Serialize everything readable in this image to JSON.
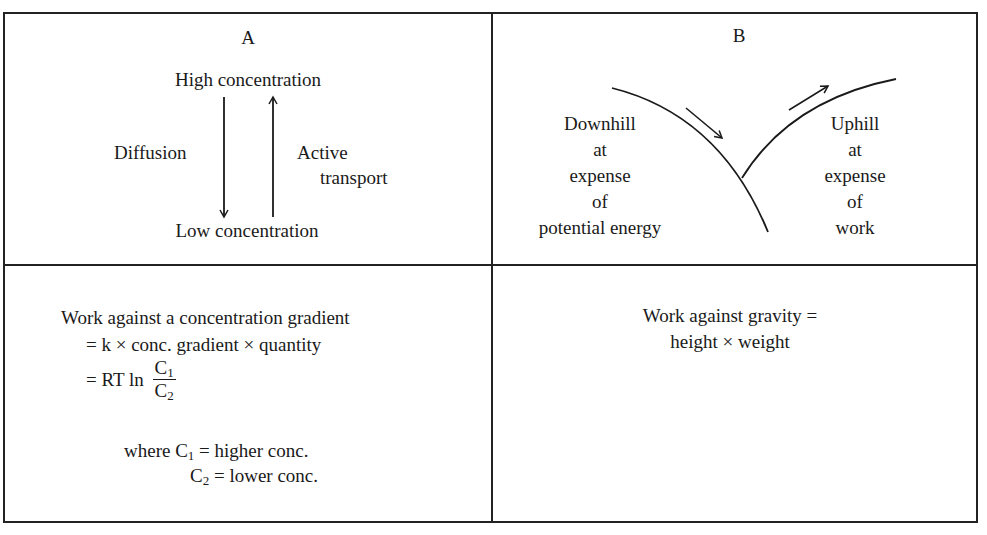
{
  "panel_a": {
    "label": "A",
    "top": "High concentration",
    "bottom": "Low concentration",
    "left_arrow_label": "Diffusion",
    "right_arrow_label_line1": "Active",
    "right_arrow_label_line2": "transport",
    "left_arrow_direction": "down",
    "right_arrow_direction": "up"
  },
  "panel_b": {
    "label": "B",
    "left_text": [
      "Downhill",
      "at",
      "expense",
      "of",
      "potential energy"
    ],
    "right_text": [
      "Uphill",
      "at",
      "expense",
      "of",
      "work"
    ]
  },
  "panel_c": {
    "line1": "Work against a concentration gradient",
    "line2": "= k × conc. gradient × quantity",
    "line3_prefix": "= RT ln",
    "frac_num": "C",
    "frac_num_sub": "1",
    "frac_den": "C",
    "frac_den_sub": "2",
    "where_prefix": "where C",
    "where_sub1": "1",
    "where_rest1": " = higher conc.",
    "where2_c": "C",
    "where_sub2": "2",
    "where_rest2": " = lower conc."
  },
  "panel_d": {
    "line1": "Work against gravity =",
    "line2": "height × weight"
  },
  "colors": {
    "ink": "#1a1a1a",
    "border": "#222222",
    "background": "#ffffff"
  }
}
